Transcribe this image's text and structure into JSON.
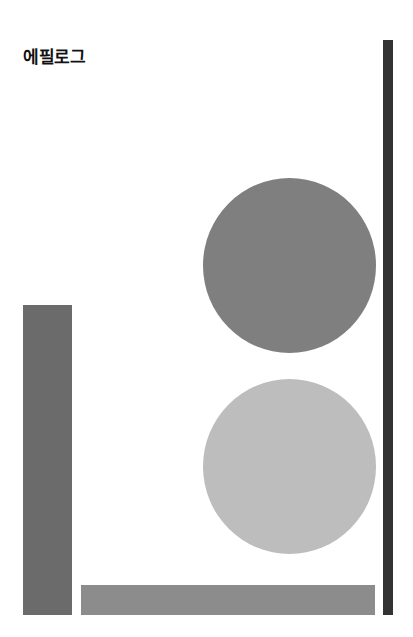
{
  "page": {
    "title": "에필로그"
  },
  "shapes": {
    "right_bar": {
      "color": "#333333"
    },
    "left_rect": {
      "color": "#6b6b6b"
    },
    "bottom_rect": {
      "color": "#8c8c8c"
    },
    "top_circle": {
      "color": "#7f7f7f"
    },
    "bottom_circle": {
      "color": "#bdbdbd"
    }
  }
}
